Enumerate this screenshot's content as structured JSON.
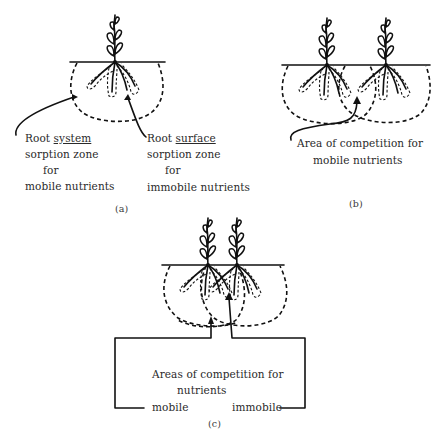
{
  "figure": {
    "panels": [
      {
        "id": "a",
        "caption": "(a)",
        "labels": {
          "left": {
            "line1_prefix": "Root ",
            "line1_underlined": "system",
            "line2": "sorption zone",
            "line3": "for",
            "line4": "mobile nutrients"
          },
          "right": {
            "line1_prefix": "Root ",
            "line1_underlined": "surface",
            "line2": "sorption zone",
            "line3": "for",
            "line4": "immobile nutrients"
          }
        }
      },
      {
        "id": "b",
        "caption": "(b)",
        "labels": {
          "line1": "Area of competition for",
          "line2": "mobile nutrients"
        }
      },
      {
        "id": "c",
        "caption": "(c)",
        "labels": {
          "line1": "Areas of competition for",
          "line2": "nutrients",
          "left": "mobile",
          "right": "immobile"
        }
      }
    ],
    "colors": {
      "ink": "#111111",
      "text": "#2a2a2a",
      "background": "#ffffff"
    }
  }
}
